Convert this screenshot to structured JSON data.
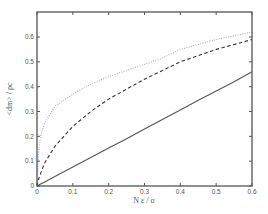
{
  "chart_data": {
    "type": "line",
    "title": "",
    "xlabel": "N ε / σ",
    "ylabel": "<dm> / ρc",
    "xlim": [
      0,
      0.6
    ],
    "ylim": [
      0,
      0.7
    ],
    "xticks": [
      "0",
      "0.1",
      "0.2",
      "0.3",
      "0.4",
      "0.5",
      "0.6"
    ],
    "yticks": [
      "0",
      "0.1",
      "0.2",
      "0.3",
      "0.4",
      "0.5",
      "0.6"
    ],
    "grid": false,
    "legend": null,
    "x": [
      0,
      0.005,
      0.01,
      0.02,
      0.05,
      0.1,
      0.15,
      0.2,
      0.25,
      0.3,
      0.35,
      0.4,
      0.45,
      0.5,
      0.55,
      0.6
    ],
    "series": [
      {
        "name": "dotted",
        "style": "dotted",
        "color": "#9a9a9a",
        "values": [
          0,
          0.15,
          0.2,
          0.25,
          0.32,
          0.37,
          0.41,
          0.44,
          0.465,
          0.49,
          0.515,
          0.55,
          0.57,
          0.59,
          0.605,
          0.62
        ]
      },
      {
        "name": "dashed",
        "style": "dashed",
        "color": "#333333",
        "values": [
          0,
          0.03,
          0.05,
          0.09,
          0.16,
          0.24,
          0.3,
          0.35,
          0.39,
          0.43,
          0.465,
          0.5,
          0.525,
          0.55,
          0.57,
          0.59
        ]
      },
      {
        "name": "solid",
        "style": "solid",
        "color": "#555555",
        "values": [
          0,
          0.004,
          0.008,
          0.015,
          0.038,
          0.077,
          0.115,
          0.153,
          0.19,
          0.23,
          0.268,
          0.306,
          0.345,
          0.383,
          0.42,
          0.46
        ]
      }
    ]
  },
  "plot": {
    "x_axis_label": "N ε / σ",
    "y_axis_label": "<dm> / ρc"
  }
}
